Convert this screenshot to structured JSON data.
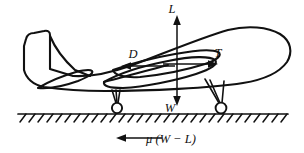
{
  "figure": {
    "background_color": "#ffffff",
    "line_color": "#111111"
  },
  "forces": [
    {
      "symbol": "L",
      "name": "lift",
      "direction": "up",
      "label_x": 172,
      "label_y": 13
    },
    {
      "symbol": "D",
      "name": "drag",
      "direction": "left",
      "label_x": 133,
      "label_y": 58
    },
    {
      "symbol": "T",
      "name": "thrust",
      "direction": "right",
      "label_x": 218,
      "label_y": 57
    },
    {
      "symbol": "W",
      "name": "weight",
      "direction": "down",
      "label_x": 170,
      "label_y": 112
    }
  ],
  "caption": {
    "arrow_direction": "left",
    "expression": "μ (W − L)"
  },
  "ground": {
    "label": "runway-surface",
    "hatch_count": 30
  },
  "aircraft": {
    "label": "airplane-silhouette",
    "parts": [
      "fuselage",
      "vertical-stabilizer",
      "horizontal-stabilizer",
      "near-wing",
      "far-wing",
      "nose-landing-gear",
      "main-landing-gear"
    ]
  }
}
